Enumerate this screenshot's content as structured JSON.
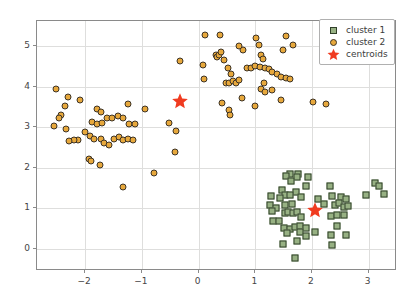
{
  "chart_data": {
    "type": "scatter",
    "title": "",
    "xlabel": "",
    "ylabel": "",
    "xlim": [
      -2.85,
      3.5
    ],
    "ylim": [
      -0.55,
      5.62
    ],
    "xticks": [
      -2,
      -1,
      0,
      1,
      2,
      3
    ],
    "xticklabels": [
      "−2",
      "−1",
      "0",
      "1",
      "2",
      "3"
    ],
    "yticks": [
      0,
      1,
      2,
      3,
      4,
      5
    ],
    "yticklabels": [
      "0",
      "1",
      "2",
      "3",
      "4",
      "5"
    ],
    "grid": true,
    "legend_position": "upper right",
    "legend": [
      {
        "label": "cluster 1",
        "marker": "square",
        "color": "#97b183",
        "edge": "#31402a"
      },
      {
        "label": "cluster 2",
        "marker": "circle",
        "color": "#e7a83c",
        "edge": "#3d3326"
      },
      {
        "label": "centroids",
        "marker": "star",
        "color": "#f03b20",
        "edge": "#f03b20"
      }
    ],
    "series": [
      {
        "name": "cluster 1",
        "marker": "square",
        "color": "#97b183",
        "edge": "#31402a",
        "points": [
          [
            1.62,
            1.84
          ],
          [
            1.76,
            1.85
          ],
          [
            1.74,
            1.78
          ],
          [
            1.55,
            1.8
          ],
          [
            1.63,
            1.67
          ],
          [
            1.93,
            1.76
          ],
          [
            1.89,
            1.55
          ],
          [
            2.32,
            1.55
          ],
          [
            1.47,
            1.45
          ],
          [
            1.72,
            1.41
          ],
          [
            1.52,
            1.33
          ],
          [
            1.61,
            1.32
          ],
          [
            1.8,
            1.28
          ],
          [
            1.43,
            1.25
          ],
          [
            1.28,
            1.3
          ],
          [
            2.11,
            1.22
          ],
          [
            2.36,
            1.3
          ],
          [
            2.52,
            1.28
          ],
          [
            2.6,
            1.23
          ],
          [
            2.95,
            1.33
          ],
          [
            3.12,
            1.62
          ],
          [
            3.18,
            1.56
          ],
          [
            3.27,
            1.35
          ],
          [
            1.26,
            1.07
          ],
          [
            1.36,
            1.0
          ],
          [
            1.52,
            1.07
          ],
          [
            1.64,
            1.1
          ],
          [
            2.22,
            1.1
          ],
          [
            2.4,
            1.08
          ],
          [
            2.48,
            1.14
          ],
          [
            2.56,
            1.04
          ],
          [
            2.63,
            1.05
          ],
          [
            1.3,
            0.92
          ],
          [
            1.52,
            0.88
          ],
          [
            1.58,
            0.9
          ],
          [
            1.66,
            0.87
          ],
          [
            1.73,
            0.9
          ],
          [
            1.8,
            0.78
          ],
          [
            2.33,
            0.8
          ],
          [
            2.45,
            0.83
          ],
          [
            2.56,
            0.83
          ],
          [
            1.31,
            0.68
          ],
          [
            1.41,
            0.69
          ],
          [
            1.5,
            0.5
          ],
          [
            1.62,
            0.49
          ],
          [
            1.7,
            0.53
          ],
          [
            1.79,
            0.55
          ],
          [
            1.9,
            0.52
          ],
          [
            2.44,
            0.56
          ],
          [
            1.56,
            0.38
          ],
          [
            1.79,
            0.41
          ],
          [
            2.06,
            0.42
          ],
          [
            1.89,
            0.31
          ],
          [
            2.33,
            0.35
          ],
          [
            2.6,
            0.34
          ],
          [
            1.74,
            0.2
          ],
          [
            1.49,
            0.11
          ],
          [
            2.35,
            0.08
          ],
          [
            1.7,
            -0.22
          ]
        ]
      },
      {
        "name": "cluster 2",
        "marker": "circle",
        "color": "#e7a83c",
        "edge": "#3d3326",
        "points": [
          [
            -2.52,
            3.94
          ],
          [
            -2.31,
            3.74
          ],
          [
            -2.09,
            3.68
          ],
          [
            -2.36,
            3.51
          ],
          [
            -2.42,
            3.31
          ],
          [
            -1.8,
            3.45
          ],
          [
            -1.73,
            3.37
          ],
          [
            -1.24,
            3.57
          ],
          [
            -0.95,
            3.45
          ],
          [
            -2.47,
            3.22
          ],
          [
            -2.55,
            3.02
          ],
          [
            -2.34,
            2.95
          ],
          [
            -1.88,
            3.12
          ],
          [
            -1.8,
            3.08
          ],
          [
            -1.71,
            3.1
          ],
          [
            -1.62,
            3.22
          ],
          [
            -1.53,
            3.22
          ],
          [
            -1.43,
            3.27
          ],
          [
            -1.34,
            3.22
          ],
          [
            -1.22,
            3.08
          ],
          [
            -1.12,
            3.07
          ],
          [
            -0.52,
            3.11
          ],
          [
            -0.4,
            2.9
          ],
          [
            -2.0,
            2.88
          ],
          [
            -1.92,
            2.78
          ],
          [
            -1.84,
            2.7
          ],
          [
            -2.12,
            2.68
          ],
          [
            -2.2,
            2.68
          ],
          [
            -2.28,
            2.66
          ],
          [
            -1.73,
            2.7
          ],
          [
            -1.66,
            2.62
          ],
          [
            -1.58,
            2.55
          ],
          [
            -1.5,
            2.72
          ],
          [
            -1.41,
            2.75
          ],
          [
            -1.33,
            2.68
          ],
          [
            -1.24,
            2.7
          ],
          [
            -1.16,
            2.68
          ],
          [
            -1.94,
            2.22
          ],
          [
            -1.9,
            2.17
          ],
          [
            -1.74,
            2.07
          ],
          [
            -1.34,
            1.52
          ],
          [
            -0.78,
            1.88
          ],
          [
            -0.42,
            2.38
          ],
          [
            -0.33,
            4.64
          ],
          [
            0.12,
            5.28
          ],
          [
            0.38,
            5.27
          ],
          [
            0.08,
            4.53
          ],
          [
            0.1,
            4.18
          ],
          [
            0.3,
            4.77
          ],
          [
            0.33,
            4.73
          ],
          [
            0.36,
            4.79
          ],
          [
            0.4,
            4.85
          ],
          [
            0.45,
            4.66
          ],
          [
            0.52,
            4.45
          ],
          [
            0.57,
            4.32
          ],
          [
            0.48,
            4.1
          ],
          [
            0.53,
            4.08
          ],
          [
            0.6,
            4.13
          ],
          [
            0.66,
            4.1
          ],
          [
            0.72,
            4.16
          ],
          [
            0.78,
            4.91
          ],
          [
            0.72,
            5.0
          ],
          [
            0.86,
            4.46
          ],
          [
            0.93,
            4.47
          ],
          [
            0.99,
            4.5
          ],
          [
            1.01,
            5.2
          ],
          [
            1.07,
            5.03
          ],
          [
            1.1,
            4.78
          ],
          [
            1.13,
            4.67
          ],
          [
            1.08,
            4.49
          ],
          [
            1.17,
            4.47
          ],
          [
            1.24,
            4.44
          ],
          [
            1.3,
            4.35
          ],
          [
            1.38,
            4.3
          ],
          [
            1.45,
            4.24
          ],
          [
            1.54,
            4.22
          ],
          [
            1.62,
            4.19
          ],
          [
            1.55,
            5.24
          ],
          [
            1.66,
            5.03
          ],
          [
            1.49,
            4.9
          ],
          [
            1.15,
            4.1
          ],
          [
            1.1,
            3.95
          ],
          [
            1.18,
            3.86
          ],
          [
            1.3,
            3.92
          ],
          [
            1.46,
            3.68
          ],
          [
            1.0,
            3.52
          ],
          [
            0.76,
            3.71
          ],
          [
            0.41,
            3.6
          ],
          [
            0.53,
            3.42
          ],
          [
            0.55,
            3.31
          ],
          [
            2.01,
            3.63
          ],
          [
            2.25,
            3.57
          ]
        ]
      },
      {
        "name": "centroids",
        "marker": "star",
        "color": "#f03b20",
        "edge": "#f03b20",
        "points": [
          [
            -0.33,
            3.64
          ],
          [
            2.06,
            0.96
          ]
        ]
      }
    ]
  }
}
